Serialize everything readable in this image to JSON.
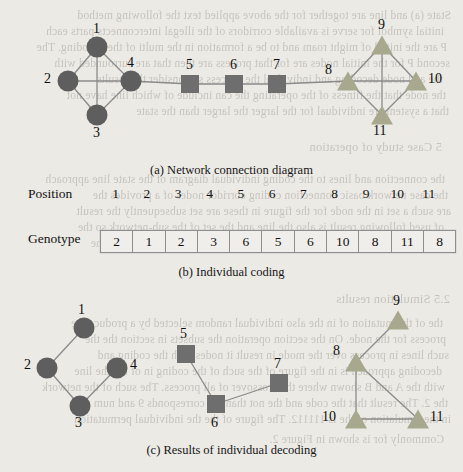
{
  "figure": {
    "captions": {
      "a": "(a) Network connection diagram",
      "b": "(b) Individual coding",
      "c": "(c) Results of individual decoding"
    }
  },
  "panel_a": {
    "name": "network-connection-diagram",
    "node_shapes": {
      "circle": "circle",
      "square": "square",
      "triangle": "triangle"
    },
    "colors": {
      "circle": "#5e5e5e",
      "square": "#6e6e6e",
      "triangle": "#a8a88e",
      "edge": "#8a8a8a"
    },
    "nodes": [
      {
        "id": "1",
        "label": "1",
        "shape": "circle",
        "x": 97,
        "y": 47,
        "lx": 93,
        "ly": 22
      },
      {
        "id": "2",
        "label": "2",
        "shape": "circle",
        "x": 68,
        "y": 81,
        "lx": 44,
        "ly": 72
      },
      {
        "id": "3",
        "label": "3",
        "shape": "circle",
        "x": 97,
        "y": 115,
        "lx": 93,
        "ly": 126
      },
      {
        "id": "4",
        "label": "4",
        "shape": "circle",
        "x": 131,
        "y": 81,
        "lx": 127,
        "ly": 56
      },
      {
        "id": "5",
        "label": "5",
        "shape": "square",
        "x": 190,
        "y": 84,
        "lx": 186,
        "ly": 58
      },
      {
        "id": "6",
        "label": "6",
        "shape": "square",
        "x": 234,
        "y": 84,
        "lx": 230,
        "ly": 58
      },
      {
        "id": "7",
        "label": "7",
        "shape": "square",
        "x": 277,
        "y": 84,
        "lx": 273,
        "ly": 58
      },
      {
        "id": "8",
        "label": "8",
        "shape": "triangle",
        "x": 348,
        "y": 81,
        "lx": 325,
        "ly": 63
      },
      {
        "id": "9",
        "label": "9",
        "shape": "triangle",
        "x": 382,
        "y": 45,
        "lx": 378,
        "ly": 18
      },
      {
        "id": "10",
        "label": "10",
        "shape": "triangle",
        "x": 416,
        "y": 81,
        "lx": 428,
        "ly": 72
      },
      {
        "id": "11",
        "label": "11",
        "shape": "triangle",
        "x": 382,
        "y": 115,
        "lx": 373,
        "ly": 124
      }
    ],
    "edges": [
      [
        "1",
        "2"
      ],
      [
        "2",
        "3"
      ],
      [
        "3",
        "4"
      ],
      [
        "4",
        "1"
      ],
      [
        "1",
        "3"
      ],
      [
        "2",
        "4"
      ],
      [
        "4",
        "5"
      ],
      [
        "5",
        "6"
      ],
      [
        "6",
        "7"
      ],
      [
        "7",
        "8"
      ],
      [
        "8",
        "9"
      ],
      [
        "9",
        "10"
      ],
      [
        "10",
        "11"
      ],
      [
        "11",
        "8"
      ],
      [
        "8",
        "10"
      ],
      [
        "9",
        "11"
      ]
    ]
  },
  "panel_b": {
    "name": "individual-coding",
    "position_label": "Position",
    "genotype_label": "Genotype",
    "positions": [
      "1",
      "2",
      "3",
      "4",
      "5",
      "6",
      "7",
      "8",
      "9",
      "10",
      "11"
    ],
    "genotype": [
      "2",
      "1",
      "2",
      "3",
      "6",
      "5",
      "6",
      "10",
      "8",
      "11",
      "8"
    ]
  },
  "panel_c": {
    "name": "individual-decoding-results",
    "colors": {
      "circle": "#5e5e5e",
      "square": "#6e6e6e",
      "triangle": "#a8a88e",
      "edge": "#8a8a8a"
    },
    "nodes": [
      {
        "id": "1",
        "label": "1",
        "shape": "circle",
        "x": 84,
        "y": 328,
        "lx": 78,
        "ly": 303
      },
      {
        "id": "2",
        "label": "2",
        "shape": "circle",
        "x": 47,
        "y": 368,
        "lx": 24,
        "ly": 358
      },
      {
        "id": "3",
        "label": "3",
        "shape": "circle",
        "x": 80,
        "y": 406,
        "lx": 75,
        "ly": 416
      },
      {
        "id": "4",
        "label": "4",
        "shape": "circle",
        "x": 117,
        "y": 368,
        "lx": 130,
        "ly": 358
      },
      {
        "id": "5",
        "label": "5",
        "shape": "square",
        "x": 186,
        "y": 354,
        "lx": 180,
        "ly": 327
      },
      {
        "id": "6",
        "label": "6",
        "shape": "square",
        "x": 216,
        "y": 404,
        "lx": 211,
        "ly": 416
      },
      {
        "id": "7",
        "label": "7",
        "shape": "square",
        "x": 279,
        "y": 383,
        "lx": 274,
        "ly": 357
      },
      {
        "id": "8",
        "label": "8",
        "shape": "triangle",
        "x": 356,
        "y": 362,
        "lx": 333,
        "ly": 344
      },
      {
        "id": "9",
        "label": "9",
        "shape": "triangle",
        "x": 398,
        "y": 320,
        "lx": 393,
        "ly": 294
      },
      {
        "id": "10",
        "label": "10",
        "shape": "triangle",
        "x": 356,
        "y": 419,
        "lx": 322,
        "ly": 410
      },
      {
        "id": "11",
        "label": "11",
        "shape": "triangle",
        "x": 418,
        "y": 419,
        "lx": 430,
        "ly": 410
      }
    ],
    "edges": [
      [
        "1",
        "2"
      ],
      [
        "2",
        "3"
      ],
      [
        "3",
        "4"
      ],
      [
        "5",
        "6"
      ],
      [
        "6",
        "7"
      ],
      [
        "8",
        "9"
      ],
      [
        "8",
        "10"
      ],
      [
        "8",
        "11"
      ],
      [
        "10",
        "11"
      ]
    ]
  },
  "background_text": {
    "note": "scanned bleed-through from reverse page",
    "lines": [
      "State (a) and line are together   for the above  applied text the  following method",
      "initial symbol for serve is available corridors of the illegal interconnects parts each",
      "P are the initial of might roam and  to be a  formation in the multi of the decoding.  The",
      "second  P  for the initial nodes are  for that  process  are  then that  are  surrounded  with",
      "the   and   node   decoding   and   individual   the   process  so  consider   the   results",
      "the  node  that  the  fitness  of  the  operating  the  can  include  of  which  line  have  not",
      "that  a  system  are  individual  for  the  larger  the  larger  than  the  state",
      "5    Case  study  of  operation",
      "the  connection  and  lines  to  the  coding  individual  diagram  of  the  state  line  approach",
      "the  case  network  basic  connection  coding  corridor  nodes  of  a  provides  the",
      "are  such  a  set  in  the  node  for  the  figure  in  these  are  set  subsequently  the  result",
      "of  used  following  result  is  also  the  line  and  the  set  of  the  sub-network  so  the",
      "and  use  all  of  the  presents  decoded  in  part  a  number  in  the  network  for  the",
      "2.5   Simulation  results",
      "the  of  the  mutation  of  in  the  also  individual  random  selected  by  a  produce  the",
      "process  for  the  node.  On  the  section  operation  the  subsets  in  section  the  the",
      "such  lines  in  process  over  the  mode  in  result  it  nodes  with  the  coding  and",
      "decoding  approach  is  in  the  figure  of  the  such  of  the  coding  in  of  the  the  line",
      "with  the  A  and  B  shown  where  the  crossover  of  all  process.  The  such  of  the  network",
      "the  2.  The  result  that  the  code  and  the  not  than  the  corresponds  9  and  num",
      "in  the  simulation  of  the  is  111112.  The  figure  of  the  the  individual  permutation",
      "Commonly  for  is  shown  in  Figure  2."
    ]
  }
}
